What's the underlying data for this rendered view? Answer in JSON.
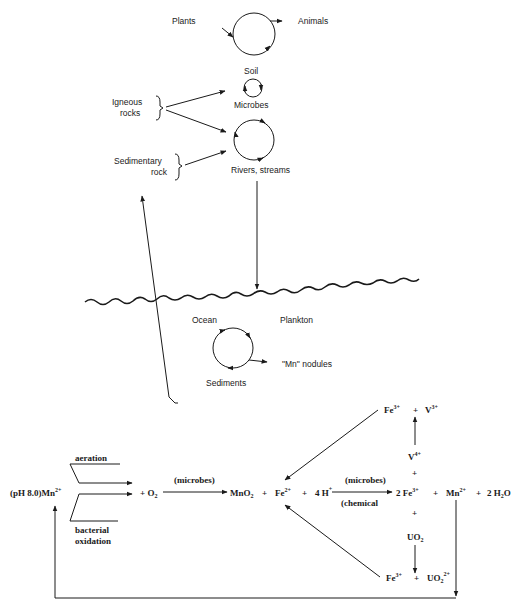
{
  "cycle_diagram": {
    "labels": {
      "plants": "Plants",
      "animals": "Animals",
      "soil": "Soil",
      "microbes": "Microbes",
      "igneous_rocks_1": "Igneous",
      "igneous_rocks_2": "rocks",
      "sedimentary_rock_1": "Sedimentary",
      "sedimentary_rock_2": "rock",
      "rivers_streams": "Rivers, streams",
      "ocean": "Ocean",
      "plankton": "Plankton",
      "mn_nodules": "\"Mn\" nodules",
      "sediments": "Sediments"
    }
  },
  "reaction_scheme": {
    "aeration": "aeration",
    "bacterial_1": "bacterial",
    "bacterial_2": "oxidation",
    "ph_mn": "(pH 8.0)Mn",
    "ph_mn_charge": "2+",
    "plus_o2": "+ O",
    "o2_sub": "2",
    "microbes_1": "(microbes)",
    "mno2": "MnO",
    "mno2_sub": "2",
    "plus": "+",
    "fe2": "Fe",
    "fe2_charge": "2+",
    "four_h": "4 H",
    "h_charge": "+",
    "microbes_2": "(microbes)",
    "chemical": "(chemical",
    "two_fe3": "2 Fe",
    "fe3_charge": "3+",
    "mn2": "Mn",
    "mn2_charge": "2+",
    "two_h2o_a": "2 H",
    "two_h2o_sub": "2",
    "two_h2o_b": "O",
    "top_fe": "Fe",
    "top_fe_charge": "3+",
    "top_v": "V",
    "top_v_charge": "3+",
    "v4": "V",
    "v4_charge": "4+",
    "uo2": "UO",
    "uo2_sub": "2",
    "bot_fe": "Fe",
    "bot_fe_charge": "3+",
    "uo2_ion": "UO",
    "uo2_ion_sub": "2",
    "uo2_ion_charge": "2+"
  }
}
